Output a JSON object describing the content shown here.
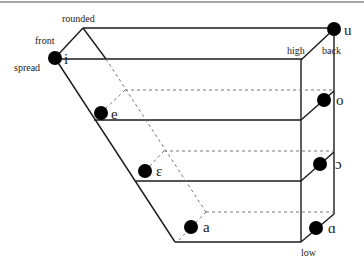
{
  "diagram": {
    "axis_labels": {
      "rounded": "rounded",
      "front": "front",
      "spread": "spread",
      "high": "high",
      "back": "back",
      "low": "low"
    },
    "vowels": [
      {
        "symbol": "i",
        "position": "front high spread",
        "x": 55,
        "y": 58,
        "label_x": 64,
        "label_y": 64
      },
      {
        "symbol": "u",
        "position": "back high rounded",
        "x": 334,
        "y": 29,
        "label_x": 344,
        "label_y": 35
      },
      {
        "symbol": "e",
        "position": "front mid-high",
        "x": 101,
        "y": 113,
        "label_x": 111,
        "label_y": 119
      },
      {
        "symbol": "o",
        "position": "back mid-high",
        "x": 324,
        "y": 100,
        "label_x": 336,
        "label_y": 105
      },
      {
        "symbol": "ɛ",
        "position": "front mid-low",
        "x": 145,
        "y": 171,
        "label_x": 156,
        "label_y": 176
      },
      {
        "symbol": "ɔ",
        "position": "back mid-low",
        "x": 320,
        "y": 164,
        "label_x": 335,
        "label_y": 169
      },
      {
        "symbol": "a",
        "position": "front low",
        "x": 191,
        "y": 227,
        "label_x": 203,
        "label_y": 232
      },
      {
        "symbol": "ɑ",
        "position": "back low",
        "x": 316,
        "y": 228,
        "label_x": 328,
        "label_y": 233
      }
    ],
    "colors": {
      "line": "#1a1a1a",
      "dashed": "#777777",
      "dot": "#000000",
      "background": "#ffffff"
    }
  }
}
